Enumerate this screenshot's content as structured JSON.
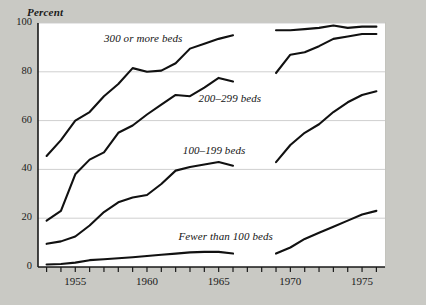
{
  "chart_data": {
    "type": "line",
    "title": "",
    "subtitle": "",
    "ylabel": "Percent",
    "xlabel": "",
    "ylim": [
      0,
      100
    ],
    "xlim": [
      1952.4,
      1976.6
    ],
    "yticks": [
      0,
      20,
      40,
      60,
      80,
      100
    ],
    "ytick_labels": [
      "0",
      "20",
      "40",
      "60",
      "80",
      "100"
    ],
    "xticks": [
      1953,
      1954,
      1955,
      1956,
      1957,
      1958,
      1959,
      1960,
      1961,
      1962,
      1963,
      1964,
      1965,
      1966,
      1967,
      1968,
      1969,
      1970,
      1971,
      1972,
      1973,
      1974,
      1975,
      1976
    ],
    "xtick_labels": [
      "1955",
      "1960",
      "1965",
      "1970",
      "1975"
    ],
    "xtick_label_values": [
      1955,
      1960,
      1965,
      1970,
      1975
    ],
    "grid": "horizontal",
    "legend_position": "inline-annotations",
    "background": "#ffffff",
    "figure_background": "#c9c9c4",
    "line_color": "#111111",
    "grid_color": "#cfcfcf",
    "axis_color": "#1a1a1a",
    "data_gap_note": "No data plotted between 1966 and 1969",
    "series": [
      {
        "name": "300 or more beds",
        "label": "300 or more beds",
        "label_x": 1957.0,
        "label_y": 93.5,
        "segments": [
          {
            "x": [
              1953,
              1954,
              1955,
              1956,
              1957,
              1958,
              1959,
              1960,
              1961,
              1962,
              1963,
              1964,
              1965,
              1966
            ],
            "y": [
              45.5,
              52.0,
              60.0,
              63.5,
              70.0,
              75.0,
              81.5,
              80.0,
              80.5,
              83.5,
              89.5,
              91.5,
              93.5,
              95.0
            ]
          },
          {
            "x": [
              1969,
              1970,
              1971,
              1972,
              1973,
              1974,
              1975,
              1976
            ],
            "y": [
              97.0,
              97.0,
              97.5,
              98.0,
              99.0,
              98.0,
              98.5,
              98.5
            ]
          }
        ]
      },
      {
        "name": "200-299 beds",
        "label": "200–299 beds",
        "label_x": 1963.6,
        "label_y": 69.0,
        "segments": [
          {
            "x": [
              1953,
              1954,
              1955,
              1956,
              1957,
              1958,
              1959,
              1960,
              1961,
              1962,
              1963,
              1964,
              1965,
              1966
            ],
            "y": [
              19.0,
              23.0,
              38.0,
              44.0,
              47.0,
              55.0,
              58.0,
              62.5,
              66.5,
              70.5,
              70.0,
              73.5,
              77.5,
              76.0
            ]
          },
          {
            "x": [
              1969,
              1970,
              1971,
              1972,
              1973,
              1974,
              1975,
              1976
            ],
            "y": [
              79.5,
              87.0,
              88.0,
              90.5,
              93.5,
              94.5,
              95.5,
              95.5
            ]
          }
        ]
      },
      {
        "name": "100-199 beds",
        "label": "100–199 beds",
        "label_x": 1962.5,
        "label_y": 47.5,
        "segments": [
          {
            "x": [
              1953,
              1954,
              1955,
              1956,
              1957,
              1958,
              1959,
              1960,
              1961,
              1962,
              1963,
              1964,
              1965,
              1966
            ],
            "y": [
              9.5,
              10.5,
              12.5,
              17.0,
              22.5,
              26.5,
              28.5,
              29.5,
              34.0,
              39.5,
              41.0,
              42.0,
              43.0,
              41.5
            ]
          },
          {
            "x": [
              1969,
              1970,
              1971,
              1972,
              1973,
              1974,
              1975,
              1976
            ],
            "y": [
              43.0,
              50.0,
              55.0,
              58.5,
              63.5,
              67.5,
              70.5,
              72.0
            ]
          }
        ]
      },
      {
        "name": "Fewer than 100 beds",
        "label": "Fewer than 100 beds",
        "label_x": 1962.2,
        "label_y": 12.5,
        "segments": [
          {
            "x": [
              1953,
              1954,
              1955,
              1956,
              1957,
              1958,
              1959,
              1960,
              1961,
              1962,
              1963,
              1964,
              1965,
              1966
            ],
            "y": [
              1.0,
              1.2,
              1.8,
              2.8,
              3.2,
              3.6,
              4.0,
              4.5,
              5.0,
              5.5,
              6.0,
              6.2,
              6.2,
              5.5
            ]
          },
          {
            "x": [
              1969,
              1970,
              1971,
              1972,
              1973,
              1974,
              1975,
              1976
            ],
            "y": [
              5.5,
              8.0,
              11.5,
              14.0,
              16.5,
              19.0,
              21.5,
              23.0
            ]
          }
        ]
      }
    ]
  }
}
